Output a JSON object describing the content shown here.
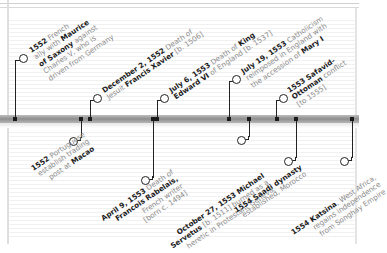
{
  "timeline": {
    "bar_color": "#9a9a9a",
    "marker_color": "#1a1a1a",
    "events_above": [
      {
        "lines": [
          {
            "b": "1552",
            "t": " French"
          },
          {
            "t": "ally with ",
            "b2": "Maurice"
          },
          {
            "b": "of Saxony",
            "t": " against"
          },
          {
            "t": "Charles V, who is"
          },
          {
            "t": "driven from Germany"
          }
        ]
      },
      {
        "lines": [
          {
            "b": "December 2, 1552",
            "t": " Death of"
          },
          {
            "t": "Jesuit ",
            "b2": "Francis Xavier",
            "t2": " [b. 1506]"
          }
        ]
      },
      {
        "lines": [
          {
            "b": "July 6, 1553",
            "t": " Death of ",
            "b2": "King"
          },
          {
            "b": "Edward VI",
            "t": " of England [b. 1537]"
          }
        ]
      },
      {
        "lines": [
          {
            "b": "July 19, 1553",
            "t": " Catholicism"
          },
          {
            "t": "reimposed in England with"
          },
          {
            "t": "the accession of ",
            "b2": "Mary I"
          }
        ]
      },
      {
        "lines": [
          {
            "b": "1553 Safavid-"
          },
          {
            "b": "Ottoman",
            "t": " conflict"
          },
          {
            "t": "[to 1555]"
          }
        ]
      }
    ],
    "events_below": [
      {
        "lines": [
          {
            "b": "1552",
            "t": " Portuguese"
          },
          {
            "t": "establish trading"
          },
          {
            "t": "post at ",
            "b2": "Macao"
          }
        ]
      },
      {
        "lines": [
          {
            "b": "April 9, 1553",
            "t": " Death of"
          },
          {
            "b": "Francois Rabelais,"
          },
          {
            "t": "French writer"
          },
          {
            "t": "[born c. 1494]"
          }
        ]
      },
      {
        "lines": [
          {
            "b": "October 27, 1553 Michael"
          },
          {
            "b": "Servetus",
            "t": " [b. 1511] burned as a"
          },
          {
            "t": "heretic in Protestant Geneva"
          }
        ]
      },
      {
        "lines": [
          {
            "b": "1554 Saadi dynasty"
          },
          {
            "t": "established, Morocco"
          }
        ]
      },
      {
        "lines": [
          {
            "b": "1554 Katsina",
            "t": ", West Africa,"
          },
          {
            "t": "regains independence"
          },
          {
            "t": "from Songhay Empire"
          }
        ]
      }
    ]
  }
}
